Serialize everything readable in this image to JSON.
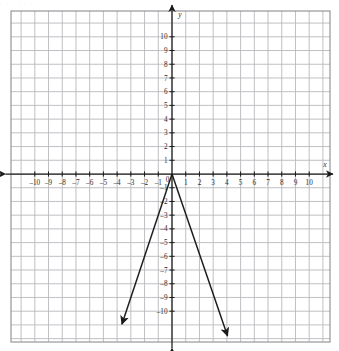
{
  "figure": {
    "kind": "cartesian-coordinate-plane",
    "background_color": "#ffffff",
    "grid_color": "#b9b9bd",
    "grid_border_color": "#8d8d92",
    "axis_color": "#1a1a1a",
    "curve_color": "#1a1a1a",
    "label_color": "#2b2b2b",
    "top_cropped_text": "· ·  ·   ·      ·  ·"
  },
  "axes": {
    "x_name": "x",
    "y_name": "y",
    "x_ticks": [
      {
        "value": -10,
        "label": "–10"
      },
      {
        "value": -9,
        "label": "–9"
      },
      {
        "value": -8,
        "label": "–8"
      },
      {
        "value": -7,
        "label": "–7"
      },
      {
        "value": -6,
        "label": "–6"
      },
      {
        "value": -5,
        "label": "–5"
      },
      {
        "value": -4,
        "label": "–4"
      },
      {
        "value": -3,
        "label": "–3"
      },
      {
        "value": -2,
        "label": "–2"
      },
      {
        "value": -1,
        "label": "–1"
      },
      {
        "value": 1,
        "label": "1"
      },
      {
        "value": 2,
        "label": "2"
      },
      {
        "value": 3,
        "label": "3"
      },
      {
        "value": 4,
        "label": "4"
      },
      {
        "value": 5,
        "label": "5"
      },
      {
        "value": 6,
        "label": "6"
      },
      {
        "value": 7,
        "label": "7"
      },
      {
        "value": 8,
        "label": "8"
      },
      {
        "value": 9,
        "label": "9"
      },
      {
        "value": 10,
        "label": "10"
      }
    ],
    "y_ticks": [
      {
        "value": 10,
        "label": "10"
      },
      {
        "value": 9,
        "label": "9"
      },
      {
        "value": 8,
        "label": "8"
      },
      {
        "value": 7,
        "label": "7"
      },
      {
        "value": 6,
        "label": "6"
      },
      {
        "value": 5,
        "label": "5"
      },
      {
        "value": 4,
        "label": "4"
      },
      {
        "value": 3,
        "label": "3"
      },
      {
        "value": 2,
        "label": "2"
      },
      {
        "value": 1,
        "label": "1"
      },
      {
        "value": -1,
        "label": "–1"
      },
      {
        "value": -2,
        "label": "–2"
      },
      {
        "value": -3,
        "label": "–3"
      },
      {
        "value": -4,
        "label": "–4"
      },
      {
        "value": -5,
        "label": "–5"
      },
      {
        "value": -6,
        "label": "–6"
      },
      {
        "value": -7,
        "label": "–7"
      },
      {
        "value": -8,
        "label": "–8"
      },
      {
        "value": -9,
        "label": "–9"
      },
      {
        "value": -10,
        "label": "–10"
      }
    ],
    "origin_label": "0"
  },
  "chart_data": {
    "type": "line",
    "title": "",
    "xlabel": "x",
    "ylabel": "y",
    "xlim": [
      -11.75,
      11.75
    ],
    "ylim": [
      -11.9,
      11.9
    ],
    "grid": true,
    "grid_step": 1,
    "legend": "none",
    "equation": "y = -3|x|",
    "vertex": [
      0,
      0
    ],
    "series": [
      {
        "name": "left-branch",
        "slope": 3,
        "points": [
          [
            0,
            0
          ],
          [
            -3.65,
            -10.95
          ]
        ],
        "arrow_at": "end"
      },
      {
        "name": "right-branch",
        "slope": -3,
        "points": [
          [
            0,
            0
          ],
          [
            4.05,
            -11.8
          ]
        ],
        "arrow_at": "end"
      }
    ]
  }
}
